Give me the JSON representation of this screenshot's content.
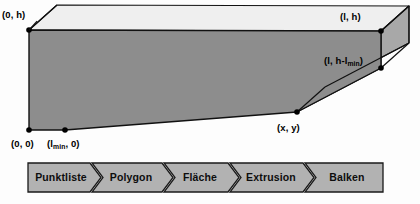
{
  "figure": {
    "colors": {
      "front_face": "#8d8d8d",
      "top_face": "#efefef",
      "side_face": "#a8a8a8",
      "outline": "#111111",
      "vertex_dot": "#000000",
      "flow_fill": "#b2b2b2",
      "flow_border": "#1a1a1a",
      "background": "#fdfdfd",
      "label_text": "#000000"
    },
    "solid": {
      "name": "extruded-beam",
      "front_face_points": "29,30 381,31 381,68 297,112 65,130 29,130",
      "top_face_points": "29,30 57,5 409,6 381,31",
      "side_face_points": "381,31 409,6 409,43 325,87 297,112 381,68",
      "depth_offset_x": 28,
      "depth_offset_y": -25
    },
    "vertices": [
      {
        "name": "origin-top-left",
        "label": "(0, h)",
        "sub": "",
        "tail": "",
        "x": 29,
        "y": 30,
        "label_x": 2,
        "label_y": 18,
        "anchor": "start"
      },
      {
        "name": "right-top",
        "label": "(l, h)",
        "sub": "",
        "tail": "",
        "x": 381,
        "y": 31,
        "label_x": 340,
        "label_y": 20,
        "anchor": "start"
      },
      {
        "name": "right-notch",
        "label": "(l, h-l",
        "sub": "min",
        "tail": ")",
        "x": 381,
        "y": 68,
        "label_x": 324,
        "label_y": 64,
        "anchor": "start"
      },
      {
        "name": "slope-point",
        "label": "(x, y)",
        "sub": "",
        "tail": "",
        "x": 297,
        "y": 112,
        "label_x": 277,
        "label_y": 131,
        "anchor": "start"
      },
      {
        "name": "origin-bottom",
        "label": "(0, 0)",
        "sub": "",
        "tail": "",
        "x": 29,
        "y": 130,
        "label_x": 11,
        "label_y": 147,
        "anchor": "start"
      },
      {
        "name": "lmin-bottom",
        "label": "(l",
        "sub": "min",
        "tail": ", 0)",
        "x": 65,
        "y": 130,
        "label_x": 47,
        "label_y": 147,
        "anchor": "start"
      }
    ]
  },
  "flow": {
    "name": "process-chevron-bar",
    "bar": {
      "x": 28,
      "y": 163,
      "width": 355,
      "height": 29
    },
    "steps": [
      {
        "label": "Punktliste"
      },
      {
        "label": "Polygon"
      },
      {
        "label": "Fläche"
      },
      {
        "label": "Extrusion"
      },
      {
        "label": "Balken"
      }
    ]
  }
}
